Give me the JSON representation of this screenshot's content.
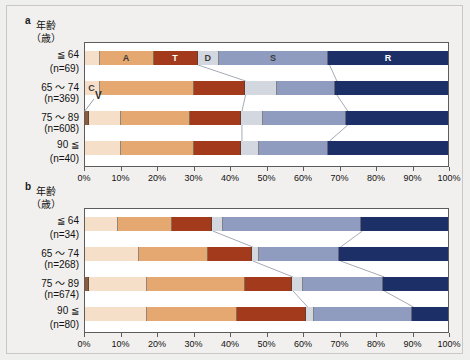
{
  "figure": {
    "background": "#efefed",
    "plot_background": "#ffffff",
    "axis_color": "#5c5c5c"
  },
  "legend_keys": {
    "V": "V",
    "C": "C",
    "A": "A",
    "T": "T",
    "D": "D",
    "S": "S",
    "R": "R"
  },
  "colors": {
    "V": "#8c5a3c",
    "C": "#f6dfc8",
    "A": "#e5a870",
    "T": "#a33a1c",
    "D": "#d3d7df",
    "S": "#8f9cc0",
    "R": "#1d2f67"
  },
  "axis": {
    "header_line1": "年齢",
    "header_line2": "（歳）",
    "ticks": [
      "0%",
      "10%",
      "20%",
      "30%",
      "40%",
      "50%",
      "60%",
      "70%",
      "80%",
      "90%",
      "100%"
    ],
    "tick_values": [
      0,
      10,
      20,
      30,
      40,
      50,
      60,
      70,
      80,
      90,
      100
    ],
    "xmin": 0,
    "xmax": 100
  },
  "panels": [
    {
      "letter": "a",
      "rows": [
        {
          "age": "≦ 64",
          "n": "(n=69)"
        },
        {
          "age": "65 〜 74",
          "n": "(n=369)"
        },
        {
          "age": "75 〜 89",
          "n": "(n=608)"
        },
        {
          "age": "90 ≦",
          "n": "(n=40)"
        }
      ]
    },
    {
      "letter": "b",
      "rows": [
        {
          "age": "≦ 64",
          "n": "(n=34)"
        },
        {
          "age": "65 〜 74",
          "n": "(n=268)"
        },
        {
          "age": "75 〜 89",
          "n": "(n=674)"
        },
        {
          "age": "90 ≦",
          "n": "(n=80)"
        }
      ]
    }
  ],
  "chart_data": {
    "type": "bar",
    "orientation": "horizontal",
    "stacked": true,
    "normalized": "100%",
    "title": "",
    "xlabel": "",
    "ylabel": "年齢（歳）",
    "xlim": [
      0,
      100
    ],
    "grid": false,
    "legend_position": "inline-segment-labels",
    "series": [
      {
        "name": "V",
        "color": "#8c5a3c"
      },
      {
        "name": "C",
        "color": "#f6dfc8"
      },
      {
        "name": "A",
        "color": "#e5a870"
      },
      {
        "name": "T",
        "color": "#a33a1c"
      },
      {
        "name": "D",
        "color": "#d3d7df"
      },
      {
        "name": "S",
        "color": "#8f9cc0"
      },
      {
        "name": "R",
        "color": "#1d2f67"
      }
    ],
    "panels": [
      {
        "panel": "a",
        "categories": [
          "≦ 64",
          "65 〜 74",
          "75 〜 89",
          "90 ≦"
        ],
        "counts": [
          69,
          369,
          608,
          40
        ],
        "rows": [
          {
            "category": "≦ 64",
            "n": 69,
            "values": {
              "V": 0.0,
              "C": 4.0,
              "A": 15.0,
              "T": 12.0,
              "D": 6.0,
              "S": 30.0,
              "R": 33.0
            }
          },
          {
            "category": "65 〜 74",
            "n": 369,
            "values": {
              "V": 0.0,
              "C": 4.0,
              "A": 26.0,
              "T": 14.0,
              "D": 9.0,
              "S": 16.0,
              "R": 31.0
            }
          },
          {
            "category": "75 〜 89",
            "n": 608,
            "values": {
              "V": 1.0,
              "C": 9.0,
              "A": 19.0,
              "T": 14.0,
              "D": 6.0,
              "S": 23.0,
              "R": 28.0
            }
          },
          {
            "category": "90 ≦",
            "n": 40,
            "values": {
              "V": 0.0,
              "C": 10.0,
              "A": 20.0,
              "T": 13.0,
              "D": 5.0,
              "S": 19.0,
              "R": 33.0
            }
          }
        ]
      },
      {
        "panel": "b",
        "categories": [
          "≦ 64",
          "65 〜 74",
          "75 〜 89",
          "90 ≦"
        ],
        "counts": [
          34,
          268,
          674,
          80
        ],
        "rows": [
          {
            "category": "≦ 64",
            "n": 34,
            "values": {
              "V": 0.0,
              "C": 9.0,
              "A": 15.0,
              "T": 11.0,
              "D": 3.0,
              "S": 38.0,
              "R": 24.0
            }
          },
          {
            "category": "65 〜 74",
            "n": 268,
            "values": {
              "V": 0.0,
              "C": 15.0,
              "A": 19.0,
              "T": 12.0,
              "D": 2.0,
              "S": 22.0,
              "R": 30.0
            }
          },
          {
            "category": "75 〜 89",
            "n": 674,
            "values": {
              "V": 1.0,
              "C": 16.0,
              "A": 27.0,
              "T": 13.0,
              "D": 3.0,
              "S": 22.0,
              "R": 18.0
            }
          },
          {
            "category": "90 ≦",
            "n": 80,
            "values": {
              "V": 0.0,
              "C": 17.0,
              "A": 25.0,
              "T": 19.0,
              "D": 2.0,
              "S": 27.0,
              "R": 10.0
            }
          }
        ]
      }
    ]
  },
  "layout": {
    "plot_left": 77,
    "plot_right": 442,
    "panel_a_plot_top": 36,
    "panel_a_plot_height": 125,
    "panel_b_plot_top": 202,
    "panel_b_plot_height": 125,
    "bar_height": 14,
    "row_pitch": 30
  }
}
